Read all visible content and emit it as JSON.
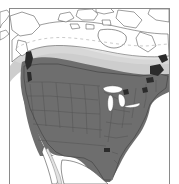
{
  "figure": {
    "type": "range-map",
    "region": "North America",
    "width_px": 179,
    "height_px": 184,
    "background_color": "#ffffff",
    "frame": {
      "color": "#8a8a8a",
      "stroke_width_px": 1.5,
      "x": 9,
      "y": 8,
      "width": 161,
      "height": 176
    }
  },
  "legend": {
    "visible": false,
    "zones": [
      {
        "name": "year-round-range",
        "color": "#6e6e6e",
        "description": "dark grey shading over the contiguous United States and southernmost Canada"
      },
      {
        "name": "seasonal-range",
        "color": "#c9c9c9",
        "description": "light grey band across central and southern Canada"
      },
      {
        "name": "no-range",
        "color": "#ffffff",
        "description": "unshaded white over northern Canada, the Arctic archipelago, Greenland edge and Mexico"
      },
      {
        "name": "dense-core",
        "color": "#2b2b2b",
        "description": "near-black patches on the British Columbia coast and the Canadian Maritimes / Newfoundland"
      }
    ]
  },
  "map": {
    "coastline_color": "#4a4a4a",
    "state_border_color": "#555555",
    "lake_color": "#ffffff",
    "features": [
      {
        "name": "contiguous-united-states",
        "shading": "year-round-range"
      },
      {
        "name": "southern-canada",
        "shading": "year-round-range"
      },
      {
        "name": "central-canada-band",
        "shading": "seasonal-range"
      },
      {
        "name": "northern-canada",
        "shading": "no-range"
      },
      {
        "name": "arctic-archipelago",
        "shading": "no-range"
      },
      {
        "name": "hudson-bay",
        "shading": "no-range"
      },
      {
        "name": "great-lakes",
        "shading": "no-range"
      },
      {
        "name": "baja-california",
        "shading": "no-range"
      },
      {
        "name": "northern-mexico",
        "shading": "no-range"
      },
      {
        "name": "british-columbia-coast",
        "shading": "dense-core"
      },
      {
        "name": "maritimes-newfoundland",
        "shading": "dense-core"
      },
      {
        "name": "alaska",
        "shading": "no-range"
      }
    ]
  }
}
